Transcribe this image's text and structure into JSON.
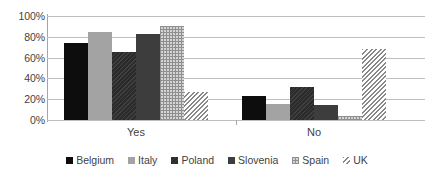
{
  "chart_data": {
    "type": "bar",
    "title": "",
    "subtitle": "",
    "xlabel": "",
    "ylabel": "",
    "categories": [
      "Yes",
      "No"
    ],
    "ylim": [
      0,
      100
    ],
    "ytick_labels": [
      "100%",
      "80%",
      "60%",
      "40%",
      "20%",
      "0%"
    ],
    "ytick_values": [
      100,
      80,
      60,
      40,
      20,
      0
    ],
    "grid": true,
    "legend_position": "bottom",
    "value_suffix": "%",
    "series": [
      {
        "name": "Belgium",
        "values": [
          74,
          23
        ],
        "color": "#0d0d0d",
        "pattern": "fine-dots"
      },
      {
        "name": "Italy",
        "values": [
          85,
          15
        ],
        "color": "#a3a3a3",
        "pattern": "solid"
      },
      {
        "name": "Poland",
        "values": [
          65,
          32
        ],
        "color": "#2b2b2b",
        "pattern": "diagonal-fine"
      },
      {
        "name": "Slovenia",
        "values": [
          83,
          14
        ],
        "color": "#3d3d3d",
        "pattern": "solid"
      },
      {
        "name": "Spain",
        "values": [
          90,
          4
        ],
        "color": "#d4d4d4",
        "pattern": "grid-dots"
      },
      {
        "name": "UK",
        "values": [
          27,
          68
        ],
        "color": "#ffffff",
        "pattern": "diagonal-hatch"
      }
    ]
  },
  "legend": {
    "items": [
      {
        "label": "Belgium"
      },
      {
        "label": "Italy"
      },
      {
        "label": "Poland"
      },
      {
        "label": "Slovenia"
      },
      {
        "label": "Spain"
      },
      {
        "label": "UK"
      }
    ]
  },
  "axis": {
    "y_labels": [
      "100%",
      "80%",
      "60%",
      "40%",
      "20%",
      "0%"
    ],
    "x_labels": [
      "Yes",
      "No"
    ]
  },
  "colors": {
    "gridline": "#bfbfbf",
    "axis": "#a6a6a6",
    "text": "#3f3f3f",
    "background": "#ffffff"
  }
}
